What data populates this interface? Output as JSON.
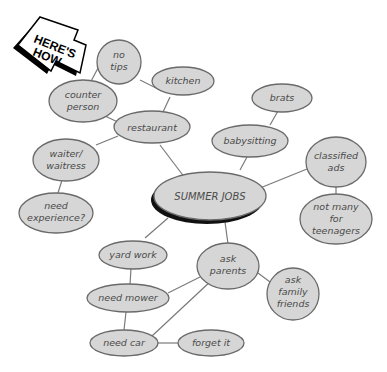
{
  "badge": {
    "line1": "HERE'S",
    "line2": "HOW"
  },
  "center": {
    "label": "SUMMER JOBS"
  },
  "nodes": {
    "no_tips": [
      "no",
      "tips"
    ],
    "kitchen": [
      "kitchen"
    ],
    "counter_person": [
      "counter",
      "person"
    ],
    "restaurant": [
      "restaurant"
    ],
    "waiter": [
      "waiter/",
      "waitress"
    ],
    "need_experience": [
      "need",
      "experience?"
    ],
    "brats": [
      "brats"
    ],
    "babysitting": [
      "babysitting"
    ],
    "classified_ads": [
      "classified",
      "ads"
    ],
    "not_many": [
      "not many",
      "for",
      "teenagers"
    ],
    "yard_work": [
      "yard work"
    ],
    "ask_parents": [
      "ask",
      "parents"
    ],
    "ask_family": [
      "ask",
      "family",
      "friends"
    ],
    "need_mower": [
      "need mower"
    ],
    "need_car": [
      "need car"
    ],
    "forget_it": [
      "forget it"
    ]
  },
  "colors": {
    "node_fill": "#d6d6d6",
    "node_stroke": "#6a6a6a",
    "shadow": "#111111"
  }
}
